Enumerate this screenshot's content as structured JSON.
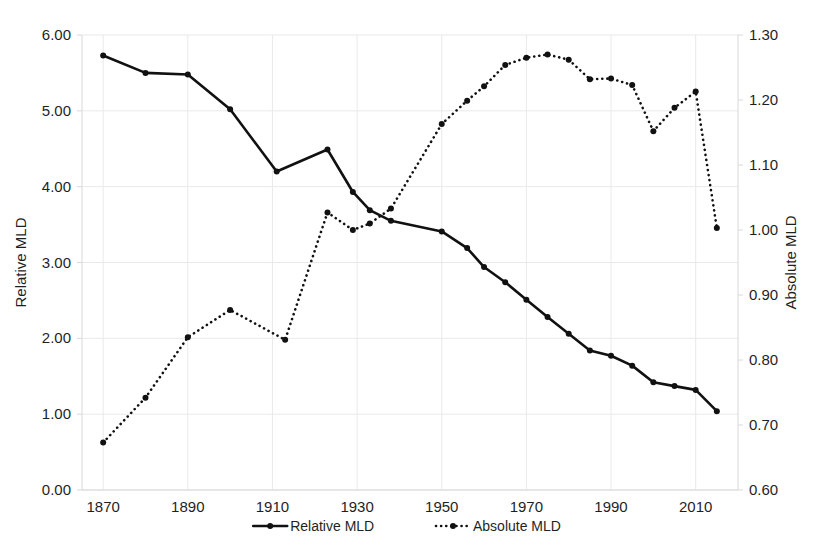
{
  "chart_data": {
    "type": "line",
    "title": "",
    "xlabel": "",
    "ylabel": "Relative MLD",
    "y2label": "Absolute MLD",
    "grid": true,
    "legend_position": "bottom",
    "xlim": [
      1865,
      2020
    ],
    "ylim": [
      0.0,
      6.0
    ],
    "y2lim": [
      0.6,
      1.3
    ],
    "x_ticks": [
      1870,
      1890,
      1910,
      1930,
      1950,
      1970,
      1990,
      2010
    ],
    "x_tick_labels": [
      "1870",
      "1890",
      "1910",
      "1930",
      "1950",
      "1970",
      "1990",
      "2010"
    ],
    "y_ticks": [
      0.0,
      1.0,
      2.0,
      3.0,
      4.0,
      5.0,
      6.0
    ],
    "y_tick_labels": [
      "0.00",
      "1.00",
      "2.00",
      "3.00",
      "4.00",
      "5.00",
      "6.00"
    ],
    "y2_ticks": [
      0.6,
      0.7,
      0.8,
      0.9,
      1.0,
      1.1,
      1.2,
      1.3
    ],
    "y2_tick_labels": [
      "0.60",
      "0.70",
      "0.80",
      "0.90",
      "1.00",
      "1.10",
      "1.20",
      "1.30"
    ],
    "series": [
      {
        "name": "Relative MLD",
        "axis": "left",
        "style": "solid",
        "color": "#111111",
        "x": [
          1870,
          1880,
          1890,
          1900,
          1911,
          1923,
          1929,
          1933,
          1938,
          1950,
          1956,
          1960,
          1965,
          1970,
          1975,
          1980,
          1985,
          1990,
          1995,
          2000,
          2005,
          2010,
          2015
        ],
        "values": [
          5.73,
          5.5,
          5.48,
          5.02,
          4.2,
          4.49,
          3.93,
          3.69,
          3.55,
          3.41,
          3.19,
          2.94,
          2.74,
          2.51,
          2.28,
          2.06,
          1.84,
          1.77,
          1.64,
          1.42,
          1.37,
          1.32,
          1.04
        ]
      },
      {
        "name": "Absolute MLD",
        "axis": "right",
        "style": "dotted",
        "color": "#111111",
        "x": [
          1870,
          1880,
          1890,
          1900,
          1913,
          1923,
          1929,
          1933,
          1938,
          1950,
          1956,
          1960,
          1965,
          1970,
          1975,
          1980,
          1985,
          1990,
          1995,
          2000,
          2005,
          2010,
          2015
        ],
        "values": [
          0.673,
          0.742,
          0.835,
          0.877,
          0.831,
          1.027,
          1.0,
          1.01,
          1.033,
          1.163,
          1.199,
          1.221,
          1.254,
          1.265,
          1.27,
          1.262,
          1.232,
          1.233,
          1.223,
          1.152,
          1.188,
          1.213,
          1.003
        ]
      }
    ],
    "legend": [
      {
        "label": "Relative MLD",
        "style": "solid"
      },
      {
        "label": "Absolute MLD",
        "style": "dotted"
      }
    ]
  },
  "colors": {
    "series": "#111111",
    "grid": "#e9e9e9",
    "frame": "#d8d8d8",
    "text": "#1f1f1f",
    "background": "#ffffff"
  }
}
